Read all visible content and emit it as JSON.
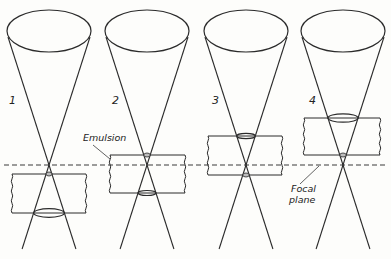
{
  "figure": {
    "focal_plane_label_line1": "Focal",
    "focal_plane_label_line2": "plane",
    "emulsion_label": "Emulsion",
    "panels": [
      {
        "label": "1",
        "emulsion_position": "below focal plane",
        "spot_small": "top",
        "spot_large": "bottom"
      },
      {
        "label": "2",
        "emulsion_position": "straddling focal plane (mostly below)",
        "spot_small": "top",
        "spot_large": "bottom"
      },
      {
        "label": "3",
        "emulsion_position": "straddling focal plane (mostly above)",
        "spot_small": "bottom",
        "spot_large": "top"
      },
      {
        "label": "4",
        "emulsion_position": "above focal plane",
        "spot_small": "bottom",
        "spot_large": "top"
      }
    ]
  }
}
